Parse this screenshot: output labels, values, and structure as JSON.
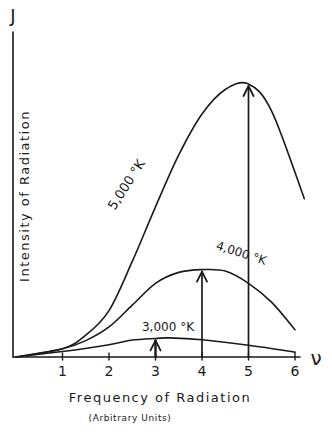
{
  "chart_data": {
    "type": "line",
    "title": "",
    "xlabel": "Frequency of Radiation",
    "xlabel_sub": "(Arbitrary Units)",
    "x_symbol": "ν",
    "ylabel": "Intensity of Radiation",
    "y_symbol": "J",
    "x_ticks": [
      "1",
      "2",
      "3",
      "4",
      "5",
      "6"
    ],
    "xlim": [
      0,
      6.2
    ],
    "ylim": [
      0,
      100
    ],
    "grid": false,
    "legend": "inline labels on curves",
    "series": [
      {
        "name": "5,000 °K",
        "label": "5,000 °K",
        "peak_frequency": 5,
        "x": [
          0,
          1,
          1.5,
          2,
          2.5,
          3,
          3.5,
          4,
          4.5,
          5,
          5.5,
          6.2
        ],
        "y": [
          0,
          3,
          8,
          17,
          35,
          55,
          74,
          89,
          98,
          100,
          90,
          58
        ]
      },
      {
        "name": "4,000 °K",
        "label": "4,000 °K",
        "peak_frequency": 4,
        "x": [
          0,
          1,
          1.5,
          2,
          2.5,
          3,
          3.5,
          4,
          4.5,
          5,
          5.5,
          6
        ],
        "y": [
          0,
          3,
          6,
          11,
          19,
          27,
          31,
          32,
          31.5,
          27,
          20,
          10
        ]
      },
      {
        "name": "3,000 °K",
        "label": "3,000 °K",
        "peak_frequency": 3,
        "x": [
          0,
          1,
          2,
          2.5,
          3,
          3.3,
          4,
          5,
          6
        ],
        "y": [
          0,
          2,
          4.5,
          6.2,
          6.8,
          7,
          6.3,
          4.3,
          1.8
        ]
      }
    ],
    "annotations": [
      {
        "type": "arrow",
        "x": 3,
        "to_series": "3,000 °K",
        "meaning": "peak frequency"
      },
      {
        "type": "arrow",
        "x": 4,
        "to_series": "4,000 °K",
        "meaning": "peak frequency"
      },
      {
        "type": "arrow",
        "x": 5,
        "to_series": "5,000 °K",
        "meaning": "peak frequency"
      }
    ]
  }
}
